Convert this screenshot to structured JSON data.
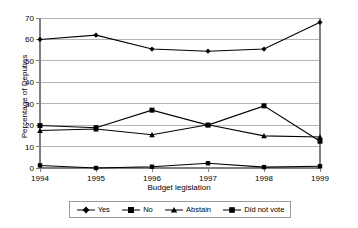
{
  "chart_data": {
    "type": "line",
    "title": "",
    "xlabel": "Budget legislation",
    "ylabel": "Percentage of Deputies",
    "categories": [
      "1994",
      "1995",
      "1996",
      "1997",
      "1998",
      "1999"
    ],
    "x_tick_labels": [
      "1994",
      "1995",
      "1996",
      "1997",
      "1998",
      "1999"
    ],
    "y_tick_labels": [
      "0",
      "10",
      "20",
      "30",
      "40",
      "50",
      "60",
      "70"
    ],
    "ylim": [
      0,
      70
    ],
    "y_tick_step": 10,
    "grid": "horizontal",
    "legend_position": "bottom",
    "series": [
      {
        "name": "Yes",
        "marker": "diamond",
        "color": "#000000",
        "values": [
          60.0,
          62.0,
          55.5,
          54.5,
          55.5,
          68.0
        ]
      },
      {
        "name": "No",
        "marker": "square",
        "color": "#000000",
        "values": [
          19.8,
          18.8,
          27.0,
          20.0,
          29.0,
          12.5
        ]
      },
      {
        "name": "Abstain",
        "marker": "triangle",
        "color": "#000000",
        "values": [
          17.5,
          18.2,
          15.5,
          20.2,
          15.0,
          14.5
        ]
      },
      {
        "name": "Did not vote",
        "marker": "square-small",
        "color": "#000000",
        "values": [
          1.2,
          0.0,
          0.6,
          2.2,
          0.4,
          0.8
        ]
      }
    ]
  },
  "legend": {
    "items": [
      {
        "label": "Yes"
      },
      {
        "label": "No"
      },
      {
        "label": "Abstain"
      },
      {
        "label": "Did not vote"
      }
    ]
  },
  "colors": {
    "line": "#000000",
    "grid": "#b5b5b5",
    "axis": "#808080",
    "text": "#000000",
    "legend_border": "#9a9a9a",
    "background": "#ffffff"
  }
}
